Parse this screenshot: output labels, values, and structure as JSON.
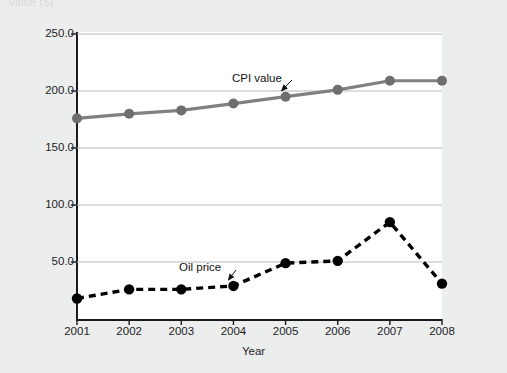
{
  "page": {
    "clipped_header_text": "Value ($)",
    "background_color": "#eceded",
    "plot_background_color": "#ffffff"
  },
  "axes": {
    "x_title": "Year",
    "y_ticks": [
      "50.0",
      "100.0",
      "150.0",
      "200.0",
      "250.0"
    ],
    "x_ticks": [
      "2001",
      "2002",
      "2003",
      "2004",
      "2005",
      "2006",
      "2007",
      "2008"
    ]
  },
  "annotations": {
    "cpi_label": "CPI value",
    "oil_label": "Oil price"
  },
  "colors": {
    "cpi_line": "#808080",
    "cpi_marker": "#6e6e6e",
    "oil_line": "#000000",
    "oil_marker": "#000000",
    "gridline": "#b9b9b9",
    "axis": "#1a1a1a",
    "text": "#1d1d1d"
  },
  "chart_data": {
    "type": "line",
    "title": "",
    "subtitle": "",
    "xlabel": "Year",
    "ylabel": "",
    "categories": [
      "2001",
      "2002",
      "2003",
      "2004",
      "2005",
      "2006",
      "2007",
      "2008"
    ],
    "x": [
      2001,
      2002,
      2003,
      2004,
      2005,
      2006,
      2007,
      2008
    ],
    "ylim": [
      0,
      250
    ],
    "xlim": [
      2001,
      2008
    ],
    "y_ticks": [
      50,
      100,
      150,
      200,
      250
    ],
    "grid": true,
    "grid_axis": "y",
    "legend": "none",
    "annotations": [
      {
        "text": "CPI value",
        "points_to_series": "CPI value",
        "points_to_x": 2005
      },
      {
        "text": "Oil price",
        "points_to_series": "Oil price",
        "points_to_x": 2004
      }
    ],
    "series": [
      {
        "name": "CPI value",
        "style": "solid",
        "color": "#808080",
        "marker": "circle",
        "values": [
          176,
          180,
          183,
          189,
          195,
          201,
          209,
          209
        ]
      },
      {
        "name": "Oil price",
        "style": "dashed",
        "color": "#000000",
        "marker": "circle",
        "values": [
          18,
          26,
          26,
          29,
          49,
          51,
          85,
          31
        ]
      }
    ]
  }
}
